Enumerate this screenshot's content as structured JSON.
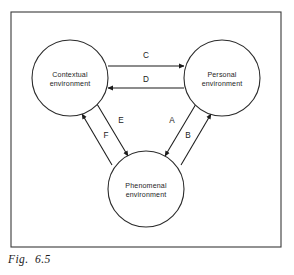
{
  "figure": {
    "caption": "Fig.  6.5",
    "frame": {
      "x": 11,
      "y": 12,
      "width": 270,
      "height": 235
    }
  },
  "chart_data": {
    "type": "diagram",
    "title": "Fig. 6.5",
    "layout": "triangular node-link diagram",
    "nodes": [
      {
        "id": "contextual",
        "line1": "Contextual",
        "line2": "environment",
        "cx": 70,
        "cy": 78,
        "r": 38
      },
      {
        "id": "personal",
        "line1": "Personal",
        "line2": "environment",
        "cx": 222,
        "cy": 78,
        "r": 38
      },
      {
        "id": "phenomenal",
        "line1": "Phenomenal",
        "line2": "environment",
        "cx": 146,
        "cy": 189,
        "r": 38
      }
    ],
    "edges": [
      {
        "label": "C",
        "from": "contextual",
        "to": "personal",
        "x1": 108,
        "y1": 66,
        "x2": 184,
        "y2": 66,
        "label_x": 146,
        "label_y": 58
      },
      {
        "label": "D",
        "from": "personal",
        "to": "contextual",
        "x1": 184,
        "y1": 88,
        "x2": 108,
        "y2": 88,
        "label_x": 146,
        "label_y": 82
      },
      {
        "label": "E",
        "from": "contextual",
        "to": "phenomenal",
        "x1": 97,
        "y1": 104,
        "x2": 128,
        "y2": 156,
        "label_x": 121,
        "label_y": 123
      },
      {
        "label": "F",
        "from": "phenomenal",
        "to": "contextual",
        "x1": 112,
        "y1": 165,
        "x2": 82,
        "y2": 114,
        "label_x": 106,
        "label_y": 138
      },
      {
        "label": "A",
        "from": "personal",
        "to": "phenomenal",
        "x1": 196,
        "y1": 104,
        "x2": 165,
        "y2": 156,
        "label_x": 172,
        "label_y": 123
      },
      {
        "label": "B",
        "from": "phenomenal",
        "to": "personal",
        "x1": 181,
        "y1": 165,
        "x2": 211,
        "y2": 114,
        "label_x": 188,
        "label_y": 138
      }
    ],
    "colors": {
      "background": "#ffffff",
      "stroke": "#1b1b1b",
      "frame_stroke": "#3a3a3a",
      "text": "#1e1e1e"
    }
  }
}
